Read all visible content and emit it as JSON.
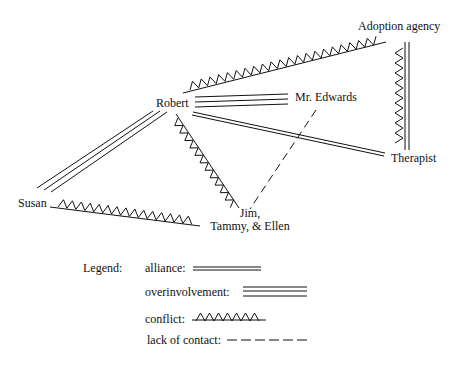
{
  "diagram": {
    "type": "family structural map",
    "nodes": {
      "adoption_agency": "Adoption agency",
      "robert": "Robert",
      "mr_edwards": "Mr. Edwards",
      "therapist": "Therapist",
      "susan": "Susan",
      "children_line1": "Jim,",
      "children_line2": "Tammy, & Ellen"
    },
    "relationships": [
      {
        "from": "Robert",
        "to": "Adoption agency",
        "type": "conflict"
      },
      {
        "from": "Robert",
        "to": "Mr. Edwards",
        "type": "overinvolvement"
      },
      {
        "from": "Robert",
        "to": "Therapist",
        "type": "alliance"
      },
      {
        "from": "Robert",
        "to": "Susan",
        "type": "overinvolvement"
      },
      {
        "from": "Robert",
        "to": "Jim, Tammy, & Ellen",
        "type": "conflict"
      },
      {
        "from": "Susan",
        "to": "Jim, Tammy, & Ellen",
        "type": "conflict"
      },
      {
        "from": "Mr. Edwards",
        "to": "Jim, Tammy, & Ellen",
        "type": "lack of contact"
      },
      {
        "from": "Adoption agency",
        "to": "Therapist",
        "type": "conflict"
      }
    ]
  },
  "legend": {
    "title": "Legend:",
    "items": [
      {
        "label": "alliance:",
        "style": "double-line"
      },
      {
        "label": "overinvolvement:",
        "style": "triple-line"
      },
      {
        "label": "conflict:",
        "style": "zigzag"
      },
      {
        "label": "lack of contact:",
        "style": "dashed"
      }
    ]
  },
  "colors": {
    "ink": "#111111",
    "background": "#ffffff"
  }
}
